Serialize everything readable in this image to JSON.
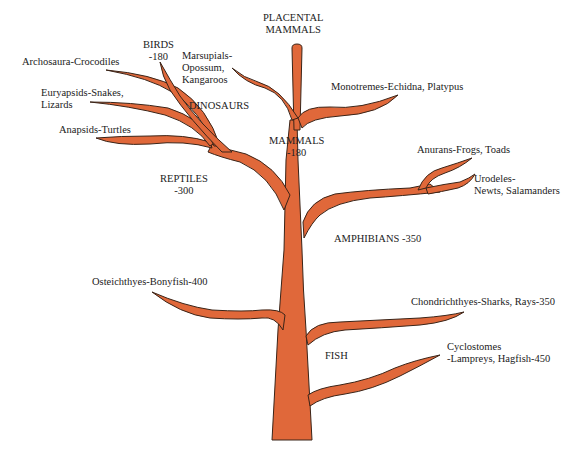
{
  "diagram": {
    "colors": {
      "branch": "#E0683A",
      "outline": "#3a2418",
      "text": "#222222",
      "background": "#ffffff"
    },
    "labels": {
      "placental_mammals": [
        "PLACENTAL",
        "MAMMALS"
      ],
      "birds": [
        "BIRDS",
        "-180"
      ],
      "marsupials": [
        "Marsupials-",
        "Opossum,",
        "Kangaroos"
      ],
      "archosaura": "Archosaura-Crocodiles",
      "euryapsids": [
        "Euryapsids-Snakes,",
        "Lizards"
      ],
      "dinosaurs": "DINOSAURS",
      "monotremes": "Monotremes-Echidna, Platypus",
      "anapsids": "Anapsids-Turtles",
      "mammals": [
        "MAMMALS",
        "-180"
      ],
      "anurans": "Anurans-Frogs, Toads",
      "urodeles": [
        "Urodeles-",
        "Newts, Salamanders"
      ],
      "reptiles": [
        "REPTILES",
        "-300"
      ],
      "amphibians": "AMPHIBIANS -350",
      "osteichthyes": "Osteichthyes-Bonyfish-400",
      "chondrichthyes": "Chondrichthyes-Sharks, Rays-350",
      "fish": "FISH",
      "cyclostomes": [
        "Cyclostomes",
        "-Lampreys, Hagfish-450"
      ]
    }
  }
}
